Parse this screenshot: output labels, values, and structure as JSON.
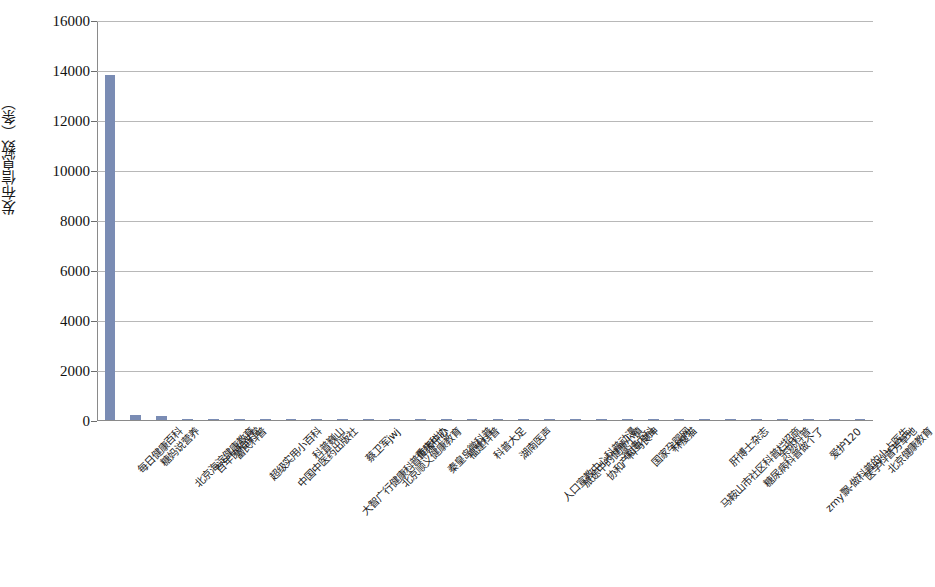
{
  "chart_data": {
    "type": "bar",
    "title": "",
    "xlabel": "",
    "ylabel": "发布信息数（条）",
    "ylim": [
      0,
      16000
    ],
    "ytick_step": 2000,
    "ytick_labels": [
      "0",
      "2000",
      "4000",
      "6000",
      "8000",
      "10000",
      "12000",
      "14000",
      "16000"
    ],
    "grid": true,
    "legend": "none",
    "bar_color": "#7a8cb4",
    "categories": [
      "每日健康百科",
      "糖妈说营养",
      "北京海淀健康教育",
      "百年协和讲堂",
      "富民科普",
      "超级实用小百科",
      "中国中医药出版社",
      "科普巍山",
      "大智广行健康科普传播中心",
      "蔡卫军jwj",
      "北京顺义健康教育",
      "重庆科协",
      "秦皇岛微科普",
      "福建科普",
      "科普大足",
      "湖南医声",
      "人口宣教中心科普动漫",
      "旅途中的健康小镇",
      "协和产科马良坤",
      "微博内科",
      "国家孕婴网",
      "林瘦猫",
      "马鞍山市社区科普栏招商",
      "肝博士杂志",
      "糖尿病科普做个了",
      "余姚科普",
      "zmy飘-做科普的小占医生",
      "爱护120",
      "医学科普芳草地",
      "北京健康教育"
    ],
    "values": [
      13800,
      215,
      160,
      45,
      40,
      35,
      32,
      30,
      28,
      26,
      25,
      24,
      23,
      22,
      21,
      20,
      19,
      18,
      18,
      17,
      16,
      16,
      15,
      15,
      14,
      14,
      13,
      13,
      12,
      12
    ]
  }
}
